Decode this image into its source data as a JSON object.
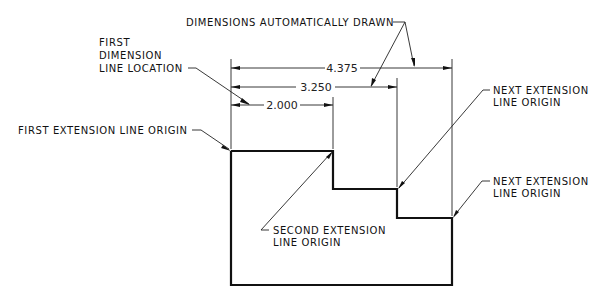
{
  "diagram": {
    "type": "dimensioning-illustration",
    "labels": {
      "auto_drawn": "DIMENSIONS AUTOMATICALLY DRAWN",
      "first_dim_line_1": "FIRST",
      "first_dim_line_2": "DIMENSION",
      "first_dim_line_3": "LINE LOCATION",
      "first_ext_origin": "FIRST EXTENSION LINE ORIGIN",
      "next_ext_origin_a_1": "NEXT EXTENSION",
      "next_ext_origin_a_2": "LINE ORIGIN",
      "next_ext_origin_b_1": "NEXT EXTENSION",
      "next_ext_origin_b_2": "LINE ORIGIN",
      "second_ext_origin_1": "SECOND EXTENSION",
      "second_ext_origin_2": "LINE ORIGIN"
    },
    "dimensions": [
      {
        "value": "2.000"
      },
      {
        "value": "3.250"
      },
      {
        "value": "4.375"
      }
    ],
    "colors": {
      "line": "#111111",
      "background": "#ffffff"
    }
  }
}
